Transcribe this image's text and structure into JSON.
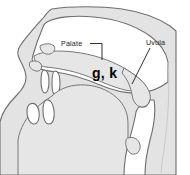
{
  "figure": {
    "type": "anatomical-line-diagram",
    "background_color": "#ffffff",
    "tissue_color": "#e3e3e3",
    "cavity_color": "#ffffff",
    "outline_color": "#6e6e6e",
    "text_color": "#1a1a1a"
  },
  "labels": {
    "palate": {
      "text": "Palate",
      "x": 61,
      "y": 46,
      "leader": "M 90 43.5 L 102 43.5 L 102 60"
    },
    "uvula": {
      "text": "Uvula",
      "x": 146,
      "y": 45,
      "leader": "M 150 48 L 132 84"
    }
  },
  "annotations": {
    "velar_place": {
      "text": "g, k",
      "x": 92,
      "y": 78
    }
  }
}
